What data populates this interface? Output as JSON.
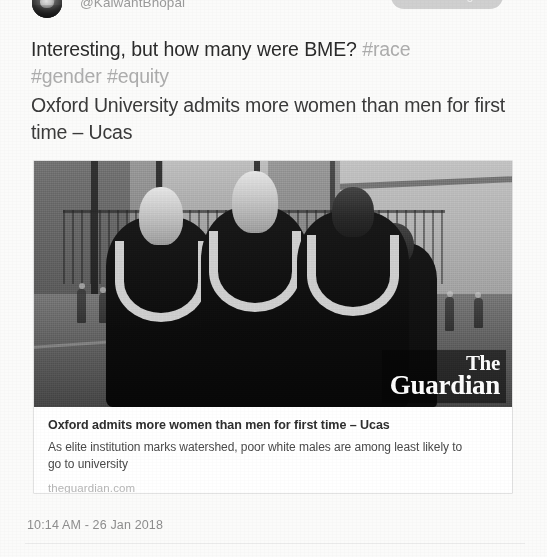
{
  "app": "twitter-tweet-detail",
  "header": {
    "avatar_name": "profile-photo",
    "handle": "@KalwantBhopal",
    "following_label": "Following",
    "more_icon": "chevron-down-icon"
  },
  "tweet": {
    "text_plain": "Interesting, but how many were BME? ",
    "hashtags": [
      "#race",
      "#gender",
      "#equity"
    ],
    "hashtag_line_1": "#race",
    "hashtag_line_2": "#gender #equity",
    "link_title": "Oxford University admits more women than men for first time – Ucas"
  },
  "link_card": {
    "image_alt": "graduates-in-gowns-photo",
    "watermark_the": "The",
    "watermark_name": "Guardian",
    "title": "Oxford admits more women than men for first time – Ucas",
    "description": "As elite institution marks watershed, poor white males are among least likely to go to university",
    "domain": "theguardian.com"
  },
  "footer": {
    "timestamp": "10:14 AM - 26 Jan 2018"
  },
  "colors": {
    "page_background": "#fbfbfa",
    "body_text": "#2b2b2b",
    "muted_text": "#8e8e8e",
    "hashtag": "#adadad",
    "card_border": "#e2e2e2",
    "following_button": "#c9c9c9"
  }
}
